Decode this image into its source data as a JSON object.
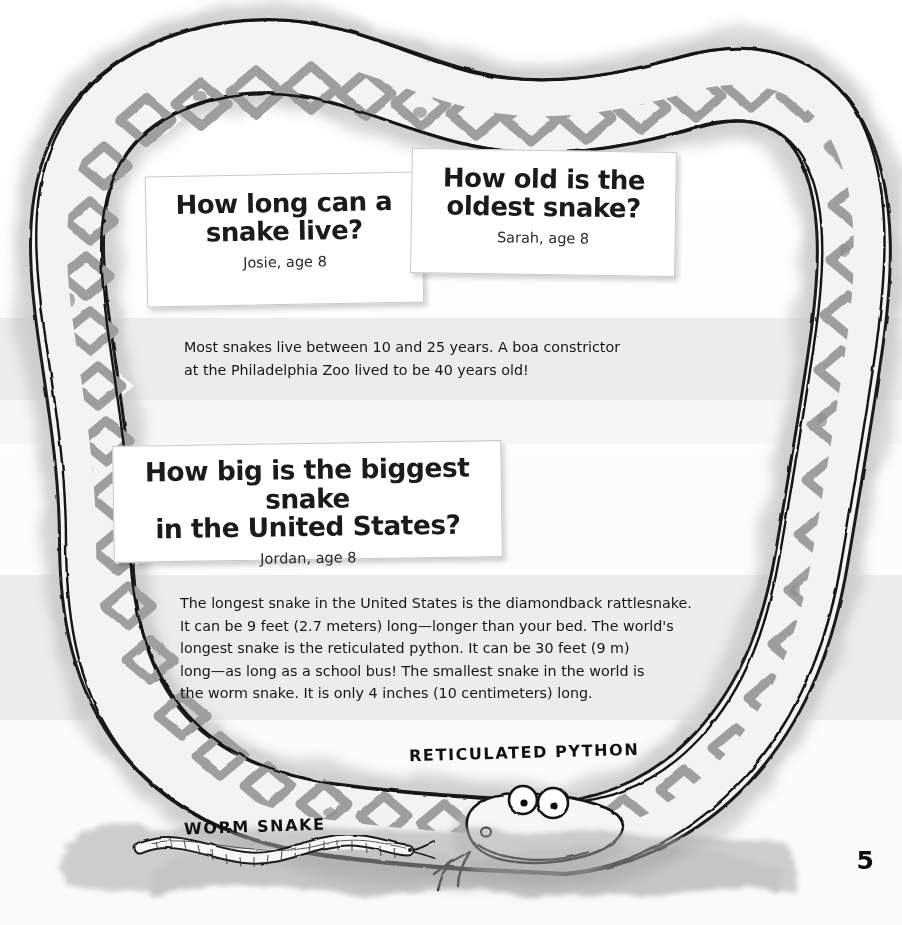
{
  "page": {
    "number": "5",
    "background_color": "#fbfbfb",
    "wash_color": "#b9b9b9"
  },
  "cards": [
    {
      "name": "how-long-can-a-snake-live",
      "question": "How long can a\nsnake live?",
      "attribution": "Josie, age 8"
    },
    {
      "name": "how-old-is-the-oldest-snake",
      "question": "How old is the\noldest snake?",
      "attribution": "Sarah, age 8"
    },
    {
      "name": "how-big-is-the-biggest-snake",
      "question": "How big is the biggest snake\nin the United States?",
      "attribution": "Jordan, age 8"
    }
  ],
  "answers": [
    {
      "name": "answer-snake-lifespan",
      "text": "Most snakes live between 10 and 25 years. A boa constrictor\nat the Philadelphia Zoo lived to be 40 years old!"
    },
    {
      "name": "answer-biggest-snake",
      "text": "The longest snake in the United States is the diamondback rattlesnake.\nIt can be 9 feet (2.7 meters) long—longer than your bed. The world's\nlongest snake is the reticulated python. It can be 30 feet (9 m)\nlong—as long as a school bus! The smallest snake in the world is\nthe worm snake. It is only 4 inches (10 centimeters) long."
    }
  ],
  "captions": {
    "python": "RETICULATED PYTHON",
    "worm": "WORM SNAKE"
  },
  "illustration": {
    "python_label": "reticulated-python-illustration",
    "worm_label": "worm-snake-illustration",
    "ink_color": "#1a1a1a",
    "scale_fill": "#f4f4f4",
    "pattern_gray": "#9a9a9a",
    "halo_gray": "#c4c4c4"
  }
}
